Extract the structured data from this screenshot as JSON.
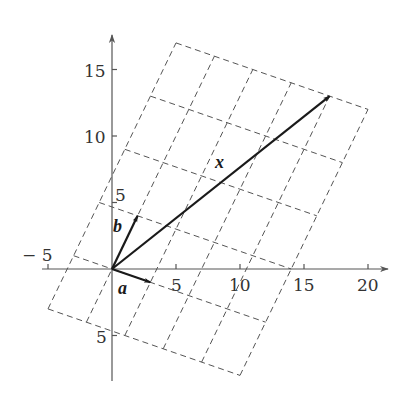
{
  "figure": {
    "labels": {
      "a": "a",
      "b": "b",
      "x": "x"
    }
  },
  "chart_data": {
    "type": "diagram",
    "title": "",
    "xlim": [
      -5.5,
      21.5
    ],
    "ylim": [
      -8.5,
      17.5
    ],
    "x_ticks": [
      {
        "value": -5,
        "label": "− 5"
      },
      {
        "value": 5,
        "label": "5"
      },
      {
        "value": 10,
        "label": "10"
      },
      {
        "value": 15,
        "label": "15"
      },
      {
        "value": 20,
        "label": "20"
      }
    ],
    "y_ticks": [
      {
        "value": 5,
        "label": "5"
      },
      {
        "value": 10,
        "label": "10"
      },
      {
        "value": 15,
        "label": "15"
      },
      {
        "value": -5,
        "label": "5"
      }
    ],
    "vectors": [
      {
        "name": "a",
        "from": [
          0,
          0
        ],
        "to": [
          3,
          -1
        ]
      },
      {
        "name": "b",
        "from": [
          0,
          0
        ],
        "to": [
          2,
          4
        ]
      },
      {
        "name": "x",
        "from": [
          0,
          0
        ],
        "to": [
          17,
          13
        ],
        "combination": "x = 3a + 4b"
      }
    ],
    "grid": {
      "basis": [
        "a",
        "b"
      ],
      "i_range": [
        -1,
        4
      ],
      "j_range": [
        -1,
        4
      ],
      "style": "dashed"
    }
  }
}
